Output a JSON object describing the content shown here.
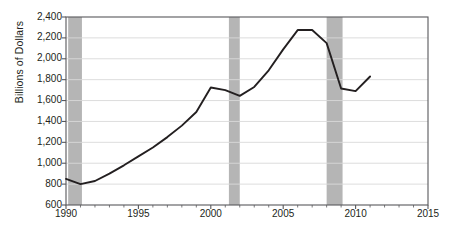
{
  "chart_data": {
    "type": "line",
    "title": "",
    "xlabel": "",
    "ylabel": "Billions of Dollars",
    "xlim": [
      1990,
      2015
    ],
    "ylim": [
      600,
      2400
    ],
    "y_tick_step": 200,
    "x_tick_step": 5,
    "grid": "horizontal",
    "legend": "none",
    "line_color": "#231f20",
    "shade_color": "#b5b5b5",
    "grid_color": "#d9d9d9",
    "axis_color": "#58585b",
    "y_ticks": [
      "600",
      "800",
      "1,000",
      "1,200",
      "1,400",
      "1,600",
      "1,800",
      "2,000",
      "2,200",
      "2,400"
    ],
    "y_tick_values": [
      600,
      800,
      1000,
      1200,
      1400,
      1600,
      1800,
      2000,
      2200,
      2400
    ],
    "x_ticks": [
      "1990",
      "1995",
      "2000",
      "2005",
      "2010",
      "2015"
    ],
    "x_tick_values": [
      1990,
      1995,
      2000,
      2005,
      2010,
      2015
    ],
    "x": [
      1990,
      1991,
      1992,
      1993,
      1994,
      1995,
      1996,
      1997,
      1998,
      1999,
      2000,
      2001,
      2002,
      2003,
      2004,
      2005,
      2006,
      2007,
      2008,
      2009,
      2010,
      2011
    ],
    "values": [
      850,
      800,
      830,
      900,
      980,
      1065,
      1150,
      1250,
      1360,
      1490,
      1725,
      1700,
      1645,
      1730,
      1890,
      2090,
      2275,
      2275,
      2150,
      1715,
      1690,
      1830
    ],
    "series": [
      {
        "name": "Billions of Dollars",
        "values": [
          850,
          800,
          830,
          900,
          980,
          1065,
          1150,
          1250,
          1360,
          1490,
          1725,
          1700,
          1645,
          1730,
          1890,
          2090,
          2275,
          2275,
          2150,
          1715,
          1690,
          1830
        ]
      }
    ],
    "shaded_regions": [
      {
        "label": "recession-band-1990",
        "start": 1990.15,
        "end": 1991.1
      },
      {
        "label": "recession-band-2001",
        "start": 2001.25,
        "end": 2002.0
      },
      {
        "label": "recession-band-2008",
        "start": 2008.0,
        "end": 2009.1
      }
    ]
  }
}
